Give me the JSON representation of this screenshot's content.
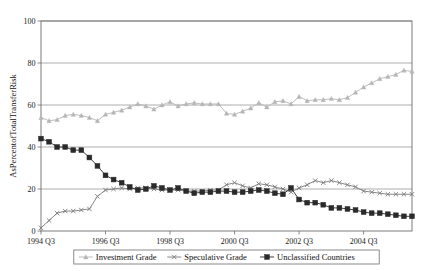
{
  "chart_data": {
    "type": "line",
    "title": "",
    "xlabel": "",
    "ylabel": "AsPercentofTotalTransferRisk",
    "ylim": [
      0,
      100
    ],
    "yticks": [
      0,
      20,
      40,
      60,
      80,
      100
    ],
    "ytick_labels": [
      "0",
      "20",
      "40",
      "60",
      "80",
      "100"
    ],
    "grid": true,
    "grid_axis": "y",
    "legend_position": "bottom-center",
    "x_start_label": "1994 Q3",
    "x_period": "quarterly",
    "xtick_labels": [
      "1994 Q3",
      "1996 Q3",
      "1998 Q3",
      "2000 Q3",
      "2002 Q3",
      "2004 Q3"
    ],
    "xtick_indices": [
      0,
      8,
      16,
      24,
      32,
      40
    ],
    "n_points": 44,
    "series": [
      {
        "name": "Investment Grade",
        "marker": "triangle",
        "color": "#b5b5b5",
        "values": [
          54.0,
          52.5,
          53.0,
          55.0,
          55.5,
          55.0,
          54.0,
          52.5,
          55.5,
          56.5,
          57.5,
          59.0,
          60.5,
          59.5,
          58.0,
          60.0,
          61.5,
          59.5,
          60.5,
          61.0,
          60.5,
          60.5,
          60.5,
          56.0,
          55.5,
          57.0,
          58.5,
          61.0,
          59.0,
          61.5,
          62.0,
          60.5,
          64.0,
          62.0,
          62.5,
          62.5,
          63.0,
          62.5,
          63.5,
          66.0,
          68.5,
          70.5,
          72.5,
          73.5,
          74.5,
          76.5,
          76.0
        ]
      },
      {
        "name": "Speculative Grade",
        "marker": "x",
        "color": "#7a7a7a",
        "values": [
          1.5,
          5.0,
          8.5,
          9.5,
          9.5,
          10.0,
          10.5,
          16.5,
          19.5,
          20.0,
          20.5,
          20.0,
          20.5,
          20.5,
          20.0,
          19.5,
          19.5,
          19.5,
          19.0,
          19.0,
          19.0,
          19.5,
          19.5,
          22.0,
          23.0,
          21.5,
          20.5,
          22.5,
          22.0,
          21.0,
          20.0,
          18.5,
          20.5,
          22.0,
          24.0,
          23.0,
          24.0,
          23.0,
          22.0,
          21.0,
          19.0,
          18.5,
          18.0,
          17.5,
          17.5,
          17.5,
          17.5
        ]
      },
      {
        "name": "Unclassified Countries",
        "marker": "square",
        "color": "#2a2a2a",
        "values": [
          44.0,
          42.5,
          40.0,
          40.0,
          38.5,
          38.5,
          35.0,
          31.0,
          26.5,
          24.5,
          23.0,
          21.0,
          19.5,
          20.0,
          21.5,
          20.5,
          19.5,
          20.5,
          19.0,
          18.0,
          18.5,
          18.5,
          19.0,
          19.0,
          18.5,
          18.5,
          19.0,
          19.5,
          19.0,
          18.0,
          17.5,
          20.5,
          15.0,
          13.5,
          13.5,
          12.5,
          11.0,
          11.0,
          10.5,
          10.0,
          9.0,
          8.5,
          8.5,
          8.0,
          7.5,
          7.0,
          7.0
        ]
      }
    ]
  },
  "legend": {
    "items": [
      {
        "label": "Investment Grade",
        "marker": "triangle-icon"
      },
      {
        "label": "Speculative Grade",
        "marker": "x-icon"
      },
      {
        "label": "Unclassified Countries",
        "marker": "square-icon"
      }
    ]
  }
}
